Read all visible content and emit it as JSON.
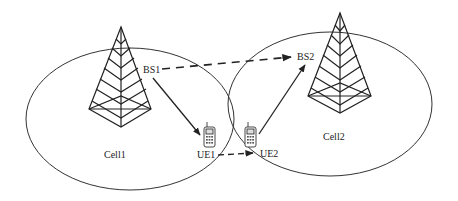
{
  "diagram": {
    "cells": [
      {
        "label": "Cell1",
        "base_station": "BS1",
        "ue": "UE1"
      },
      {
        "label": "Cell2",
        "base_station": "BS2",
        "ue": "UE2"
      }
    ],
    "labels": {
      "bs1": "BS1",
      "bs2": "BS2",
      "ue1": "UE1",
      "ue2": "UE2",
      "cell1": "Cell1",
      "cell2": "Cell2"
    },
    "links": [
      {
        "from": "BS1",
        "to": "BS2",
        "style": "dashed"
      },
      {
        "from": "BS1",
        "to": "UE1",
        "style": "solid"
      },
      {
        "from": "UE1",
        "to": "UE2",
        "style": "dashed"
      },
      {
        "from": "UE2",
        "to": "BS2",
        "style": "solid"
      }
    ],
    "colors": {
      "stroke": "#222222",
      "background": "#ffffff"
    }
  }
}
